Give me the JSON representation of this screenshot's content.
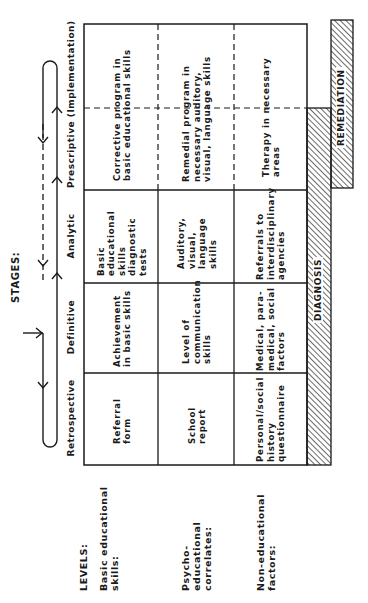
{
  "title": "STAGES:",
  "levels_title": "LEVELS:",
  "stages": [
    {
      "id": "retrospective",
      "label": "Retrospective"
    },
    {
      "id": "definitive",
      "label": "Definitive"
    },
    {
      "id": "analytic",
      "label": "Analytic"
    },
    {
      "id": "prescriptive",
      "label": "Prescriptive (Implementation)"
    }
  ],
  "levels": [
    {
      "id": "basic",
      "label": "Basic educational skills:"
    },
    {
      "id": "psycho",
      "label": "Psycho-educational correlates:"
    },
    {
      "id": "non",
      "label": "Non-educational factors:"
    }
  ],
  "cells": {
    "basic": {
      "retrospective": "Referral form",
      "definitive": "Achievement in basic skills",
      "analytic": "Basic educational skills diagnostic tests",
      "prescriptive": "Corrective program in basic educational skills"
    },
    "psycho": {
      "retrospective": "School report",
      "definitive": "Level of communication skills",
      "analytic": "Auditory, visual, language skills",
      "prescriptive": "Remedial program in necessary auditory, visual, language skills"
    },
    "non": {
      "retrospective": "Personal/social history questionnaire",
      "definitive": "Medical, para-medical, social factors",
      "analytic": "Referrals to interdisciplinary agencies",
      "prescriptive": "Therapy in necessary areas"
    }
  },
  "bars": {
    "diagnosis": "DIAGNOSIS",
    "remediation": "REMEDIATION"
  },
  "colors": {
    "ink": "#1a1a1a",
    "background": "#ffffff"
  }
}
